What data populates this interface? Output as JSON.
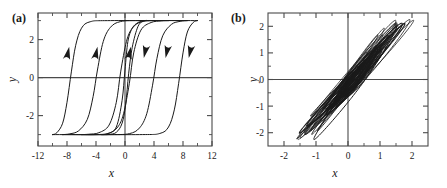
{
  "figure": {
    "background": "#ffffff",
    "line_color": "#1a1a1a",
    "axis_color": "#4a4a4a",
    "width": 447,
    "height": 188
  },
  "panels": [
    {
      "id": "a",
      "label": "(a)",
      "xlabel": "x",
      "ylabel": "y"
    },
    {
      "id": "b",
      "label": "(b)",
      "xlabel": "x",
      "ylabel": "y"
    }
  ],
  "chart_data": [
    {
      "type": "line",
      "panel": "a",
      "title": "(a)",
      "xlabel": "x",
      "ylabel": "y",
      "xlim": [
        -12,
        12
      ],
      "ylim": [
        -3.6,
        3.4
      ],
      "xticks": [
        -12,
        -8,
        -4,
        0,
        4,
        8,
        12
      ],
      "xticklabels": [
        "-12",
        "-8",
        "-4",
        "0",
        "4",
        "8",
        "12"
      ],
      "yticks": [
        -2,
        0,
        2
      ],
      "yticklabels": [
        "-2",
        "0",
        "2"
      ],
      "minor_ticks": true,
      "grid": false,
      "legend": null,
      "description": "Nested hysteresis loops: four rectangular-ish ferroelectric-like hysteresis loops of increasing drive amplitude, saturating at y = +/-3. Arrows mark traversal direction: upward arrows on the left (ascending) branches, downward arrows on the right (descending) branches.",
      "saturation": [
        -3,
        3
      ],
      "loops": [
        {
          "name": "loop-1-smallest",
          "amplitude_x": 3.2,
          "coercive_x": 1.2,
          "points_ascending": [
            [
              -3.2,
              -3.0
            ],
            [
              -2.4,
              -2.95
            ],
            [
              -1.2,
              -2.6
            ],
            [
              -0.4,
              -1.2
            ],
            [
              0.0,
              0.4
            ],
            [
              0.4,
              1.9
            ],
            [
              1.0,
              2.6
            ],
            [
              1.8,
              2.9
            ],
            [
              2.6,
              3.0
            ],
            [
              3.2,
              3.0
            ]
          ],
          "points_descending": [
            [
              3.2,
              3.0
            ],
            [
              2.6,
              2.98
            ],
            [
              1.8,
              2.7
            ],
            [
              1.0,
              1.6
            ],
            [
              0.5,
              0.2
            ],
            [
              0.1,
              -1.4
            ],
            [
              -0.4,
              -2.4
            ],
            [
              -1.2,
              -2.88
            ],
            [
              -2.2,
              -2.99
            ],
            [
              -3.2,
              -3.0
            ]
          ]
        },
        {
          "name": "loop-2",
          "amplitude_x": 6.0,
          "coercive_x": 2.6,
          "points_ascending": [
            [
              -6.0,
              -3.0
            ],
            [
              -5.0,
              -2.98
            ],
            [
              -3.6,
              -2.9
            ],
            [
              -2.2,
              -2.5
            ],
            [
              -1.2,
              -1.3
            ],
            [
              -0.6,
              0.3
            ],
            [
              0.2,
              1.9
            ],
            [
              1.0,
              2.6
            ],
            [
              2.2,
              2.93
            ],
            [
              4.0,
              3.0
            ],
            [
              6.0,
              3.0
            ]
          ],
          "points_descending": [
            [
              6.0,
              3.0
            ],
            [
              5.0,
              2.98
            ],
            [
              3.6,
              2.9
            ],
            [
              2.2,
              2.5
            ],
            [
              1.2,
              1.3
            ],
            [
              0.6,
              -0.3
            ],
            [
              -0.2,
              -1.9
            ],
            [
              -1.0,
              -2.6
            ],
            [
              -2.2,
              -2.93
            ],
            [
              -4.0,
              -3.0
            ],
            [
              -6.0,
              -3.0
            ]
          ]
        },
        {
          "name": "loop-3",
          "amplitude_x": 8.6,
          "coercive_x": 4.6,
          "points_ascending": [
            [
              -8.6,
              -3.0
            ],
            [
              -7.6,
              -2.96
            ],
            [
              -6.4,
              -2.8
            ],
            [
              -5.2,
              -2.2
            ],
            [
              -4.4,
              -1.0
            ],
            [
              -3.8,
              0.4
            ],
            [
              -3.0,
              1.9
            ],
            [
              -2.0,
              2.65
            ],
            [
              -0.6,
              2.95
            ],
            [
              2.0,
              3.0
            ],
            [
              8.6,
              3.0
            ]
          ],
          "points_descending": [
            [
              8.6,
              3.0
            ],
            [
              7.6,
              2.96
            ],
            [
              6.4,
              2.8
            ],
            [
              5.2,
              2.2
            ],
            [
              4.4,
              1.0
            ],
            [
              3.8,
              -0.4
            ],
            [
              3.0,
              -1.9
            ],
            [
              2.0,
              -2.65
            ],
            [
              0.6,
              -2.95
            ],
            [
              -2.0,
              -3.0
            ],
            [
              -8.6,
              -3.0
            ]
          ]
        },
        {
          "name": "loop-4-largest",
          "amplitude_x": 10.0,
          "coercive_x": 7.0,
          "points_ascending": [
            [
              -10.0,
              -3.0
            ],
            [
              -9.4,
              -2.9
            ],
            [
              -8.6,
              -2.4
            ],
            [
              -8.0,
              -1.3
            ],
            [
              -7.4,
              0.3
            ],
            [
              -6.8,
              1.7
            ],
            [
              -6.0,
              2.6
            ],
            [
              -4.8,
              2.94
            ],
            [
              -2.0,
              3.0
            ],
            [
              10.0,
              3.0
            ]
          ],
          "points_descending": [
            [
              10.0,
              3.0
            ],
            [
              9.4,
              2.9
            ],
            [
              8.6,
              2.4
            ],
            [
              8.0,
              1.3
            ],
            [
              7.4,
              -0.3
            ],
            [
              6.8,
              -1.7
            ],
            [
              6.0,
              -2.6
            ],
            [
              4.8,
              -2.94
            ],
            [
              2.0,
              -3.0
            ],
            [
              -10.0,
              -3.0
            ]
          ]
        }
      ],
      "arrows": [
        {
          "x": -8.0,
          "y": 1.15,
          "direction": "up"
        },
        {
          "x": -4.1,
          "y": 1.15,
          "direction": "up"
        },
        {
          "x": 0.5,
          "y": 1.15,
          "direction": "up"
        },
        {
          "x": 2.9,
          "y": 1.5,
          "direction": "down"
        },
        {
          "x": 5.9,
          "y": 1.5,
          "direction": "down"
        },
        {
          "x": 9.1,
          "y": 1.5,
          "direction": "down"
        }
      ]
    },
    {
      "type": "line",
      "panel": "b",
      "title": "(b)",
      "xlabel": "x",
      "ylabel": "y",
      "xlim": [
        -2.5,
        2.5
      ],
      "ylim": [
        -2.5,
        2.5
      ],
      "xticks": [
        -2,
        -1,
        0,
        1,
        2
      ],
      "xticklabels": [
        "-2",
        "-1",
        "0",
        "1",
        "2"
      ],
      "yticks": [
        -2,
        -1,
        0,
        1,
        2
      ],
      "yticklabels": [
        "-2",
        "-1",
        "0",
        "1",
        "2"
      ],
      "minor_ticks": true,
      "grid": false,
      "legend": null,
      "description": "Chaotic attractor: a dense tangle of many overlapping, positively-tilted elongated loops centered near the origin, spanning roughly x in [-1.4, 1.8] and y in [-1.9, 2.1], forming a dark filled band along the slope-1 diagonal.",
      "extent": {
        "x": [
          -1.4,
          1.8
        ],
        "y": [
          -1.9,
          2.1
        ]
      },
      "n_loops": 46,
      "tilt_slope": 1.35,
      "dense_core": {
        "x": [
          -0.9,
          0.9
        ],
        "y": [
          -1.2,
          1.2
        ]
      }
    }
  ]
}
